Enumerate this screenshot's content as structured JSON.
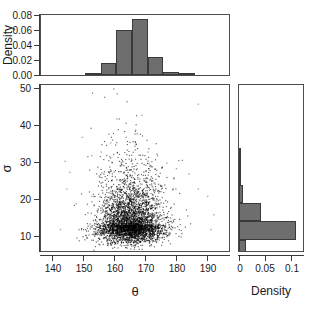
{
  "figure": {
    "background": "#ffffff",
    "bar_fill": "#6e6e6e",
    "bar_edge": "#3a3a3a",
    "point_color": "#000000"
  },
  "top_histogram": {
    "ylabel": "Density",
    "yticks": [
      "0.00",
      "0.02",
      "0.04",
      "0.06",
      "0.08"
    ]
  },
  "scatter": {
    "xlabel": "θ",
    "ylabel": "σ",
    "xticks": [
      "140",
      "150",
      "160",
      "170",
      "180",
      "190"
    ],
    "yticks": [
      "10",
      "20",
      "30",
      "40",
      "50"
    ]
  },
  "right_histogram": {
    "xlabel": "Density",
    "xticks": [
      "0",
      "0.05",
      "0.1"
    ]
  },
  "chart_data": [
    {
      "type": "bar",
      "name": "theta-marginal-density",
      "title": "",
      "xlabel": "θ",
      "ylabel": "Density",
      "orientation": "vertical",
      "grid": false,
      "xlim": [
        136,
        196
      ],
      "ylim": [
        0.0,
        0.088
      ],
      "bin_width": 5,
      "bin_edges": [
        145,
        150,
        155,
        160,
        165,
        170,
        175,
        180,
        185,
        190
      ],
      "categories": [
        "145-150",
        "150-155",
        "155-160",
        "160-165",
        "165-170",
        "170-175",
        "175-180",
        "180-185",
        "185-190"
      ],
      "values": [
        0.0,
        0.003,
        0.018,
        0.066,
        0.082,
        0.027,
        0.004,
        0.001,
        0.0
      ]
    },
    {
      "type": "bar",
      "name": "sigma-marginal-density",
      "title": "",
      "xlabel": "Density",
      "ylabel": "σ",
      "orientation": "horizontal",
      "grid": false,
      "xlim": [
        0.0,
        0.125
      ],
      "ylim": [
        7,
        52
      ],
      "bin_width": 5,
      "bin_edges": [
        5,
        10,
        15,
        20,
        25,
        30,
        35,
        40,
        45,
        50
      ],
      "categories": [
        "5-10",
        "10-15",
        "15-20",
        "20-25",
        "25-30",
        "30-35",
        "35-40",
        "40-45",
        "45-50"
      ],
      "values": [
        0.013,
        0.112,
        0.043,
        0.008,
        0.002,
        0.0005,
        0.0,
        0.0,
        0.0
      ]
    },
    {
      "type": "scatter",
      "name": "theta-sigma-posterior-samples",
      "title": "",
      "xlabel": "θ",
      "ylabel": "σ",
      "grid": false,
      "xlim": [
        136,
        196
      ],
      "ylim": [
        7,
        52
      ],
      "xticks": [
        140,
        150,
        160,
        170,
        180,
        190
      ],
      "yticks": [
        10,
        20,
        30,
        40,
        50
      ],
      "n_points": 4000,
      "center": {
        "theta": 164.5,
        "sigma": 14.2
      },
      "spread": {
        "theta_sd": 5.2,
        "sigma_sd": 2.9
      },
      "description": "Dense black cloud of MCMC posterior samples centred near theta=164.5, sigma=14, with a right-skewed sigma tail reaching about 45 and sparse outliers between theta 140 and 192."
    }
  ]
}
